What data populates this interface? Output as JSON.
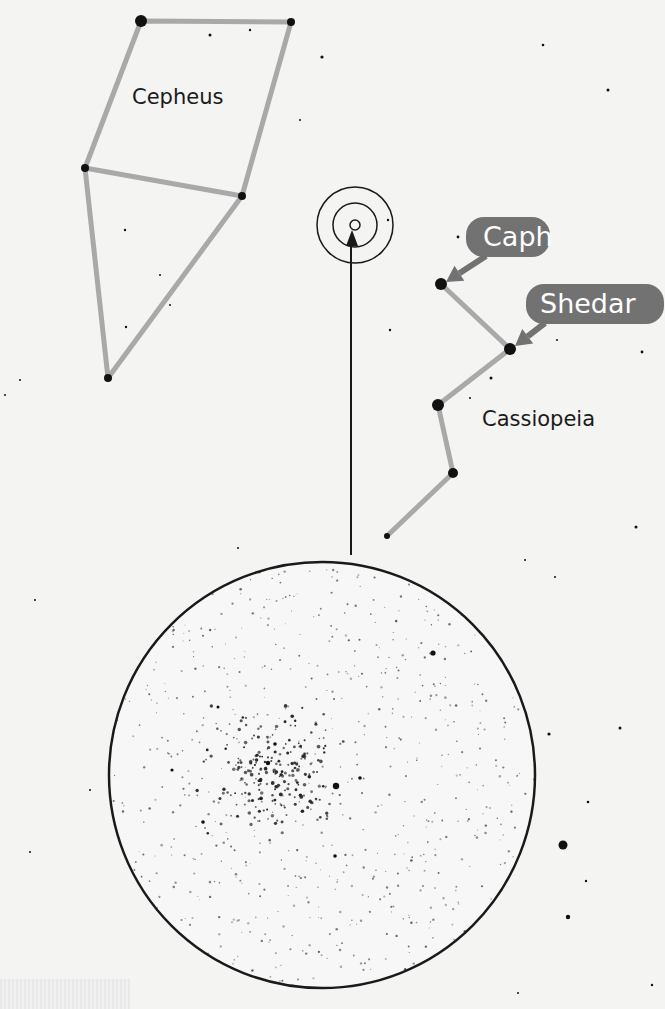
{
  "colors": {
    "background": "#f4f4f3",
    "constellation_line": "#a9a9a9",
    "callout_fill": "#727272",
    "callout_text": "#ffffff",
    "star": "#111111",
    "outline": "#1a1a1a"
  },
  "constellations": [
    {
      "name": "Cepheus",
      "label": "Cepheus",
      "label_pos": [
        132,
        104
      ],
      "stars": [
        [
          141,
          21,
          6
        ],
        [
          291,
          22,
          4
        ],
        [
          85,
          168,
          4
        ],
        [
          242,
          196,
          4
        ],
        [
          108,
          378,
          4
        ]
      ],
      "lines": [
        [
          [
            141,
            21
          ],
          [
            291,
            22
          ],
          [
            242,
            196
          ],
          [
            85,
            168
          ],
          [
            141,
            21
          ]
        ],
        [
          [
            85,
            168
          ],
          [
            108,
            378
          ],
          [
            242,
            196
          ]
        ]
      ]
    },
    {
      "name": "Cassiopeia",
      "label": "Cassiopeia",
      "label_pos": [
        482,
        426
      ],
      "stars": [
        [
          441,
          284,
          6
        ],
        [
          510,
          349,
          6
        ],
        [
          438,
          405,
          6
        ],
        [
          453,
          473,
          5
        ],
        [
          387,
          536,
          3
        ]
      ],
      "lines": [
        [
          [
            441,
            284
          ],
          [
            510,
            349
          ],
          [
            438,
            405
          ],
          [
            453,
            473
          ],
          [
            387,
            536
          ]
        ]
      ]
    }
  ],
  "callouts": [
    {
      "label": "Caph",
      "box": [
        466,
        217,
        84,
        40
      ],
      "text_pos": [
        483,
        246
      ],
      "arrow_from": [
        486,
        256
      ],
      "arrow_to": [
        446,
        282
      ]
    },
    {
      "label": "Shedar",
      "box": [
        526,
        284,
        138,
        40
      ],
      "text_pos": [
        540,
        313
      ],
      "arrow_from": [
        545,
        323
      ],
      "arrow_to": [
        515,
        346
      ]
    }
  ],
  "target_marker": {
    "cx": 355,
    "cy": 225,
    "radii": [
      38,
      22,
      5
    ]
  },
  "pointer_arrow": {
    "x": 351,
    "y_from": 555,
    "y_to": 230
  },
  "eyepiece_view": {
    "cx": 322,
    "cy": 775,
    "r": 213,
    "description": "Telescopic view of open star cluster"
  },
  "field_stars": [
    [
      210,
      35,
      1.5
    ],
    [
      250,
      30,
      1.2
    ],
    [
      322,
      57,
      1.6
    ],
    [
      543,
      45,
      1.3
    ],
    [
      608,
      90,
      1.5
    ],
    [
      277,
      75,
      1
    ],
    [
      300,
      120,
      1
    ],
    [
      125,
      230,
      1.2
    ],
    [
      160,
      275,
      1
    ],
    [
      126,
      327,
      1.2
    ],
    [
      170,
      305,
      1
    ],
    [
      388,
      220,
      1.2
    ],
    [
      458,
      237,
      1.4
    ],
    [
      390,
      330,
      1.2
    ],
    [
      491,
      378,
      1.5
    ],
    [
      470,
      398,
      1
    ],
    [
      642,
      352,
      1.4
    ],
    [
      557,
      340,
      1
    ],
    [
      636,
      527,
      1.5
    ],
    [
      555,
      577,
      1
    ],
    [
      620,
      728,
      1.5
    ],
    [
      549,
      734,
      1.6
    ],
    [
      588,
      802,
      1.3
    ],
    [
      563,
      845,
      4.5
    ],
    [
      586,
      881,
      1.2
    ],
    [
      568,
      917,
      2.2
    ],
    [
      652,
      985,
      1.2
    ],
    [
      518,
      993,
      1
    ],
    [
      35,
      600,
      1
    ],
    [
      30,
      852,
      1
    ],
    [
      210,
      655,
      1
    ],
    [
      525,
      560,
      1
    ],
    [
      20,
      380,
      1
    ],
    [
      5,
      395,
      1
    ],
    [
      238,
      548,
      1
    ],
    [
      90,
      790,
      1
    ]
  ],
  "cluster_seed": 52
}
